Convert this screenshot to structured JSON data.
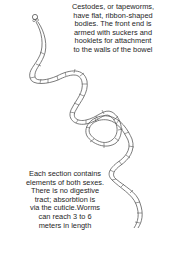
{
  "figure": {
    "illustration_icon": "tapeworm-illustration",
    "colors": {
      "background": "#ffffff",
      "line": "#555555",
      "text": "#1e1e1e"
    }
  },
  "captions": {
    "top": "Cestodes, or tapeworms,\nhave flat, ribbon-shaped\nbodies. The front end is\narmed with suckers and\nhooklets for attachment\nto the walls of the bowel",
    "bottom": "Each section contains\nelements of both sexes.\nThere is no digestive\ntract; absorbtion is\nvia the cuticle.Worms\ncan reach 3 to 6\nmeters in length"
  }
}
